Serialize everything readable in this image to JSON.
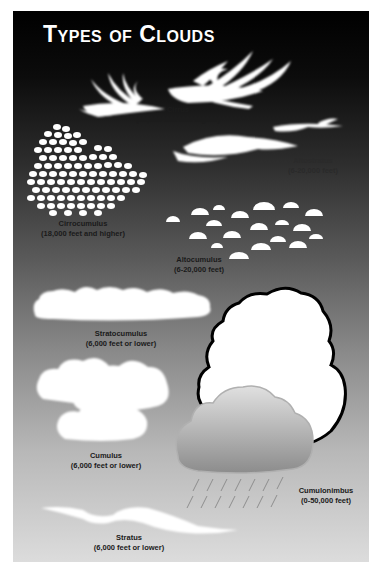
{
  "title": "Types of Clouds",
  "colors": {
    "background_top": "#000000",
    "background_bottom": "#dcdcdc",
    "cloud": "#ffffff",
    "label_text": "#1a1a1a"
  },
  "clouds": [
    {
      "name": "Cirrus",
      "altitude": "(18,000 feet and higher)"
    },
    {
      "name": "Altostratus",
      "altitude": "(6-20,000 feet)"
    },
    {
      "name": "Cirrocumulus",
      "altitude": "(18,000 feet and higher)"
    },
    {
      "name": "Altocumulus",
      "altitude": "(6-20,000 feet)"
    },
    {
      "name": "Stratocumulus",
      "altitude": "(6,000 feet or lower)"
    },
    {
      "name": "Cumulus",
      "altitude": "(6,000 feet or lower)"
    },
    {
      "name": "Cumulonimbus",
      "altitude": "(0-50,000 feet)"
    },
    {
      "name": "Stratus",
      "altitude": "(6,000 feet or lower)"
    }
  ]
}
